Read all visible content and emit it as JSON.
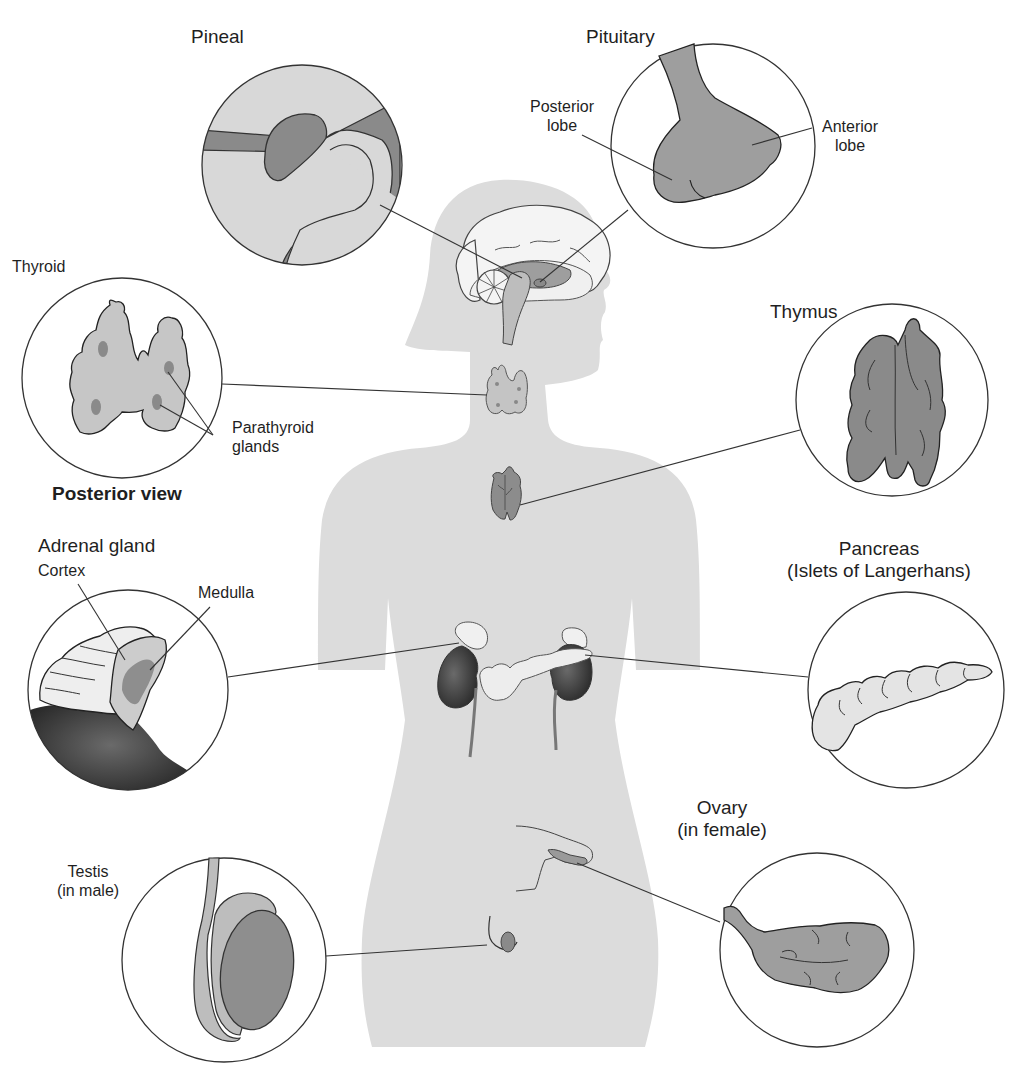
{
  "figure": {
    "colors": {
      "background": "#ffffff",
      "silhouette": "#dcdcdc",
      "organ_light": "#e6e6e6",
      "organ_mid": "#b4b4b4",
      "organ_dark": "#8a8a8a",
      "organ_darkest": "#3a3a3a",
      "line": "#333333"
    }
  },
  "labels": {
    "pineal": "Pineal",
    "pituitary": "Pituitary",
    "posterior_lobe_1": "Posterior",
    "posterior_lobe_2": "lobe",
    "anterior_lobe_1": "Anterior",
    "anterior_lobe_2": "lobe",
    "thyroid": "Thyroid",
    "parathyroid_1": "Parathyroid",
    "parathyroid_2": "glands",
    "posterior_view": "Posterior view",
    "thymus": "Thymus",
    "adrenal": "Adrenal gland",
    "cortex": "Cortex",
    "medulla": "Medulla",
    "pancreas_1": "Pancreas",
    "pancreas_2": "(Islets of Langerhans)",
    "ovary_1": "Ovary",
    "ovary_2": "(in female)",
    "testis_1": "Testis",
    "testis_2": "(in male)"
  },
  "callouts": [
    {
      "name": "pineal",
      "circle": {
        "cx": 302,
        "cy": 165,
        "r": 100
      }
    },
    {
      "name": "pituitary",
      "circle": {
        "cx": 713,
        "cy": 146,
        "r": 102
      }
    },
    {
      "name": "thyroid",
      "circle": {
        "cx": 122,
        "cy": 378,
        "r": 100
      }
    },
    {
      "name": "thymus",
      "circle": {
        "cx": 892,
        "cy": 400,
        "r": 96
      }
    },
    {
      "name": "adrenal",
      "circle": {
        "cx": 128,
        "cy": 690,
        "r": 100
      }
    },
    {
      "name": "pancreas",
      "circle": {
        "cx": 906,
        "cy": 690,
        "r": 98
      }
    },
    {
      "name": "testis",
      "circle": {
        "cx": 224,
        "cy": 960,
        "r": 102
      }
    },
    {
      "name": "ovary",
      "circle": {
        "cx": 817,
        "cy": 950,
        "r": 97
      }
    }
  ]
}
